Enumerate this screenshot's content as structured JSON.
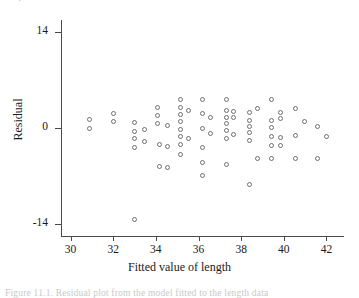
{
  "figure": {
    "top_clipped_text": "·",
    "bottom_clipped_text": "Figure 11.1.  Residual plot from the model fitted to the length data",
    "background_color": "#ffffff",
    "marker_color": "#6e6e6e",
    "axis_color": "#4a4a4a"
  },
  "chart_data": {
    "type": "scatter",
    "title": "",
    "xlabel": "Fitted value of length",
    "ylabel": "Residual",
    "xlim": [
      29.6,
      42.4
    ],
    "ylim": [
      -15.2,
      15.2
    ],
    "xticks": [
      30,
      32,
      34,
      36,
      38,
      40,
      42
    ],
    "xtick_labels": [
      "30",
      "32",
      "34",
      "36",
      "38",
      "40",
      "42"
    ],
    "yticks": [
      14,
      0,
      -14
    ],
    "ytick_labels": [
      "14",
      "0",
      "-14"
    ],
    "grid": false,
    "legend": null,
    "marker": "open-circle",
    "n_points": 96,
    "points": [
      [
        30.9,
        1.2
      ],
      [
        30.9,
        0.0
      ],
      [
        32.0,
        2.1
      ],
      [
        32.0,
        0.9
      ],
      [
        33.0,
        0.8
      ],
      [
        33.0,
        -0.5
      ],
      [
        33.0,
        -1.6
      ],
      [
        33.0,
        -2.8
      ],
      [
        33.0,
        -13.4
      ],
      [
        33.45,
        -0.2
      ],
      [
        33.45,
        -1.9
      ],
      [
        34.1,
        3.0
      ],
      [
        34.1,
        1.9
      ],
      [
        34.1,
        0.7
      ],
      [
        34.15,
        -2.4
      ],
      [
        34.15,
        -5.6
      ],
      [
        34.55,
        0.3
      ],
      [
        34.55,
        -2.7
      ],
      [
        34.55,
        -5.7
      ],
      [
        35.15,
        4.1
      ],
      [
        35.15,
        3.0
      ],
      [
        35.15,
        2.0
      ],
      [
        35.15,
        1.0
      ],
      [
        35.15,
        -0.2
      ],
      [
        35.15,
        -1.3
      ],
      [
        35.15,
        -2.4
      ],
      [
        35.15,
        -3.9
      ],
      [
        35.55,
        2.6
      ],
      [
        35.55,
        -1.5
      ],
      [
        36.2,
        4.2
      ],
      [
        36.2,
        2.1
      ],
      [
        36.2,
        0.0
      ],
      [
        36.2,
        -2.8
      ],
      [
        36.2,
        -5.0
      ],
      [
        36.2,
        -7.0
      ],
      [
        36.55,
        1.5
      ],
      [
        36.55,
        -0.8
      ],
      [
        37.3,
        4.1
      ],
      [
        37.3,
        2.6
      ],
      [
        37.3,
        1.6
      ],
      [
        37.3,
        0.6
      ],
      [
        37.3,
        -0.4
      ],
      [
        37.3,
        -1.6
      ],
      [
        37.3,
        -5.3
      ],
      [
        37.65,
        2.4
      ],
      [
        37.65,
        1.6
      ],
      [
        37.65,
        -0.9
      ],
      [
        38.4,
        2.2
      ],
      [
        38.4,
        1.1
      ],
      [
        38.4,
        0.2
      ],
      [
        38.4,
        -0.7
      ],
      [
        38.4,
        -1.8
      ],
      [
        38.4,
        -8.3
      ],
      [
        38.75,
        2.9
      ],
      [
        38.75,
        -4.5
      ],
      [
        39.4,
        4.1
      ],
      [
        39.4,
        1.1
      ],
      [
        39.4,
        0.1
      ],
      [
        39.4,
        -1.3
      ],
      [
        39.4,
        -2.5
      ],
      [
        39.4,
        -4.4
      ],
      [
        39.85,
        2.3
      ],
      [
        39.85,
        1.4
      ],
      [
        39.85,
        -1.4
      ],
      [
        39.85,
        -2.6
      ],
      [
        40.55,
        2.8
      ],
      [
        40.55,
        -1.1
      ],
      [
        40.55,
        -4.4
      ],
      [
        40.95,
        0.9
      ],
      [
        41.6,
        0.2
      ],
      [
        41.6,
        -4.4
      ],
      [
        42.0,
        -1.3
      ]
    ]
  }
}
